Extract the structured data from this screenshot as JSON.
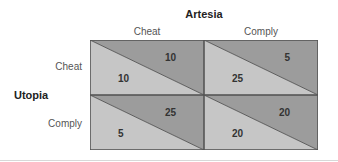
{
  "matrix": {
    "column_player": "Artesia",
    "row_player": "Utopia",
    "columns": [
      "Cheat",
      "Comply"
    ],
    "rows": [
      "Cheat",
      "Comply"
    ],
    "cells": [
      [
        {
          "row_payoff": "10",
          "col_payoff": "10"
        },
        {
          "row_payoff": "25",
          "col_payoff": "5"
        }
      ],
      [
        {
          "row_payoff": "5",
          "col_payoff": "25"
        },
        {
          "row_payoff": "20",
          "col_payoff": "20"
        }
      ]
    ]
  },
  "colors": {
    "upper_triangle": "#9c9c9c",
    "lower_triangle": "#c6c6c6",
    "border": "#555555"
  }
}
